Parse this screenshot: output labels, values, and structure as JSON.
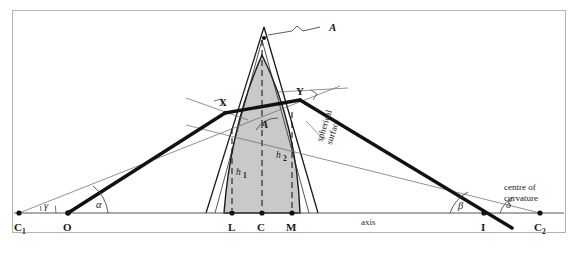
{
  "figure": {
    "type": "optics-ray-diagram",
    "frame_color": "#b4b4b4",
    "lens_fill": "#c9c9c9",
    "lens_stroke": "#1a1a1a",
    "ray_color": "#111111",
    "construction_color": "#6e6e6e",
    "axis_color": "#555555"
  },
  "axis": {
    "label": "axis",
    "y": 213
  },
  "points": [
    {
      "id": "C1",
      "label": "C",
      "sub": "1",
      "x": 19,
      "y": 213
    },
    {
      "id": "O",
      "label": "O",
      "sub": "",
      "x": 68,
      "y": 213
    },
    {
      "id": "L",
      "label": "L",
      "sub": "",
      "x": 232,
      "y": 213
    },
    {
      "id": "C",
      "label": "C",
      "sub": "",
      "x": 262,
      "y": 213
    },
    {
      "id": "M",
      "label": "M",
      "sub": "",
      "x": 292,
      "y": 213
    },
    {
      "id": "I",
      "label": "I",
      "sub": "",
      "x": 484,
      "y": 213
    },
    {
      "id": "C2",
      "label": "C",
      "sub": "2",
      "x": 540,
      "y": 213
    }
  ],
  "ray_points": [
    {
      "id": "X",
      "label": "X",
      "x": 225,
      "y": 113
    },
    {
      "id": "Y",
      "label": "Y",
      "x": 300,
      "y": 100
    }
  ],
  "angles": [
    {
      "id": "gamma",
      "label": "γ",
      "x": 47,
      "y": 207
    },
    {
      "id": "alpha",
      "label": "α",
      "x": 99,
      "y": 206
    },
    {
      "id": "beta",
      "label": "β",
      "x": 460,
      "y": 207
    },
    {
      "id": "delta",
      "label": "δ",
      "x": 508,
      "y": 206
    }
  ],
  "heights": [
    {
      "id": "h1",
      "label": "h",
      "sub": "1",
      "x": 234,
      "y": 172
    },
    {
      "id": "h2",
      "label": "h",
      "sub": "2",
      "x": 278,
      "y": 156
    }
  ],
  "apex": {
    "label": "A",
    "label_x": 333,
    "label_y": 28,
    "vertex_x": 264,
    "vertex_y": 27
  },
  "prism_angle": {
    "label": "A",
    "x": 265,
    "y": 124
  },
  "annotations": [
    {
      "id": "spherical-surface",
      "lines": [
        "spherical",
        "surface"
      ],
      "x": 318,
      "y": 152,
      "rotated": true
    },
    {
      "id": "centre-of-curvature",
      "lines": [
        "centre of",
        "curvature"
      ],
      "x": 530,
      "y": 192,
      "rotated": false
    }
  ]
}
